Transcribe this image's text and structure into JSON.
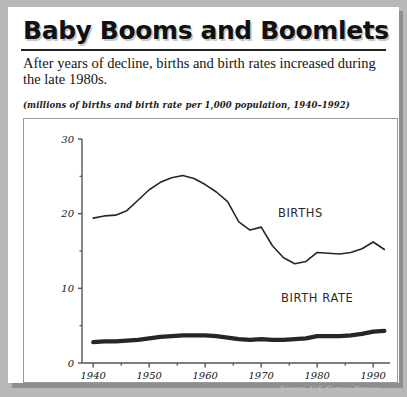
{
  "header": {
    "title": "Baby Booms and Boomlets",
    "subtitle": "After years of decline, births and birth rates increased during the late 1980s.",
    "units_note": "(millions of births and birth rate per 1,000 population, 1940–1992)"
  },
  "footer": {
    "source": "Source: U.S. Census Bureau"
  },
  "colors": {
    "page_background": "#b8b8b8",
    "panel": "#ffffff",
    "ink": "#1a1a1a",
    "line": "#262626",
    "axis": "#555555",
    "frame": "#9a9a9a"
  },
  "chart_data": {
    "type": "line",
    "title": "Baby Booms and Boomlets",
    "subtitle": "After years of decline, births and birth rates increased during the late 1980s.",
    "xlabel": "",
    "ylabel": "",
    "xlim": [
      1938,
      1993
    ],
    "ylim": [
      0,
      30
    ],
    "grid": false,
    "legend_position": "inline-annotation",
    "x_ticks_major": [
      1940,
      1950,
      1960,
      1970,
      1980,
      1990
    ],
    "x_ticks_minor": [
      1945,
      1955,
      1965,
      1975,
      1985
    ],
    "y_ticks_major": [
      0,
      10,
      20,
      30
    ],
    "y_ticks_minor": [
      5,
      15,
      25
    ],
    "x_tick_labels": [
      "1940",
      "1950",
      "1960",
      "1970",
      "1980",
      "1990"
    ],
    "y_tick_labels": [
      "0",
      "10",
      "20",
      "30"
    ],
    "annotations": [
      {
        "text": "BIRTHS",
        "x": 1977,
        "y": 19.5
      },
      {
        "text": "BIRTH RATE",
        "x": 1980,
        "y": 8.2
      }
    ],
    "x": [
      1940,
      1942,
      1944,
      1946,
      1948,
      1950,
      1952,
      1954,
      1956,
      1958,
      1960,
      1962,
      1964,
      1966,
      1968,
      1970,
      1972,
      1974,
      1976,
      1978,
      1980,
      1982,
      1984,
      1986,
      1988,
      1990,
      1992
    ],
    "series": [
      {
        "name": "BIRTHS",
        "units": "millions",
        "line_width": 1.6,
        "values": [
          19.4,
          19.7,
          19.8,
          20.4,
          21.8,
          23.2,
          24.2,
          24.8,
          25.1,
          24.7,
          23.9,
          22.9,
          21.6,
          18.9,
          17.8,
          18.2,
          15.7,
          14.1,
          13.3,
          13.6,
          14.8,
          14.7,
          14.6,
          14.8,
          15.3,
          16.2,
          15.2
        ]
      },
      {
        "name": "BIRTH RATE",
        "units": "per 1,000 population",
        "line_width": 4.2,
        "values": [
          2.8,
          2.9,
          2.9,
          3.0,
          3.1,
          3.3,
          3.5,
          3.6,
          3.7,
          3.7,
          3.7,
          3.6,
          3.4,
          3.2,
          3.1,
          3.2,
          3.1,
          3.1,
          3.2,
          3.3,
          3.6,
          3.6,
          3.6,
          3.7,
          3.9,
          4.2,
          4.3
        ]
      }
    ]
  }
}
